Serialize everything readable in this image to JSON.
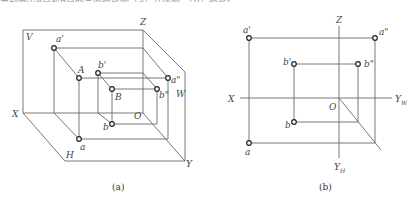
{
  "header_text_cropped": "分别画出A点和B点的三面投影图（a）立体图，（b）投影图",
  "figures": [
    {
      "id": "a",
      "caption": "(a)",
      "type": "isometric three-plane projection",
      "planes": [
        "V",
        "H",
        "W"
      ],
      "axes": [
        "X",
        "Y",
        "Z"
      ],
      "origin": "O",
      "points": [
        "A",
        "B"
      ],
      "projections": [
        "a'",
        "a\"",
        "a",
        "b'",
        "b\"",
        "b"
      ],
      "labels": {
        "V": "V",
        "H": "H",
        "W": "W",
        "X": "X",
        "Y": "Y",
        "Z": "Z",
        "O": "O",
        "A": "A",
        "B": "B",
        "a_front": "a'",
        "a_side": "a\"",
        "a_top": "a",
        "b_front": "b'",
        "b_side": "b\"",
        "b_top": "b"
      }
    },
    {
      "id": "b",
      "caption": "(b)",
      "type": "orthographic projection layout",
      "axes": [
        "X",
        "Z",
        "Y_W",
        "Y_H"
      ],
      "origin": "O",
      "labels": {
        "X": "X",
        "Z": "Z",
        "O": "O",
        "YW": "Y",
        "YW_sub": "W",
        "YH": "Y",
        "YH_sub": "H",
        "a_front": "a'",
        "a_side": "a\"",
        "a_top": "a",
        "b_front": "b'",
        "b_side": "b\"",
        "b_top": "b"
      }
    }
  ]
}
